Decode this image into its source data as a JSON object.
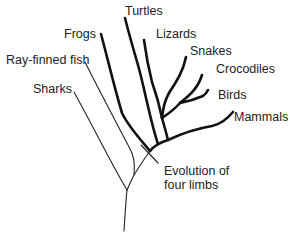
{
  "diagram": {
    "type": "phylogenetic-tree",
    "colors": {
      "line": "#111111",
      "text": "#222222",
      "background": "#ffffff"
    },
    "taxa": [
      {
        "id": "sharks",
        "label": "Sharks"
      },
      {
        "id": "ray_finned_fish",
        "label": "Ray-finned fish"
      },
      {
        "id": "frogs",
        "label": "Frogs"
      },
      {
        "id": "turtles",
        "label": "Turtles"
      },
      {
        "id": "lizards",
        "label": "Lizards"
      },
      {
        "id": "snakes",
        "label": "Snakes"
      },
      {
        "id": "crocodiles",
        "label": "Crocodiles"
      },
      {
        "id": "birds",
        "label": "Birds"
      },
      {
        "id": "mammals",
        "label": "Mammals"
      }
    ],
    "annotation": {
      "line1": "Evolution of",
      "line2": "four limbs"
    },
    "legend_note": "Thick lines indicate four-limbed lineages (tetrapods); thin lines indicate fish lineages"
  }
}
